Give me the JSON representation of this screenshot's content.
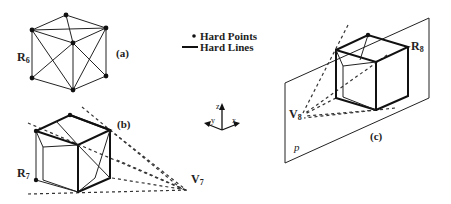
{
  "legend": {
    "hard_points_label": "Hard Points",
    "hard_lines_label": "Hard Lines",
    "point_symbol": "dot",
    "line_symbol": "solid-line"
  },
  "axes_triad": {
    "z_label": "z",
    "y_label": "y",
    "x_label": "x"
  },
  "panels": {
    "a": {
      "caption": "(a)",
      "region_label": "R",
      "region_subscript": "6",
      "description": "Hexagonal silhouette with 7 hard points and triangulated hard lines"
    },
    "b": {
      "caption": "(b)",
      "region_label": "R",
      "region_subscript": "7",
      "viewpoint_label": "V",
      "viewpoint_subscript": "7",
      "description": "Cube viewed from viewpoint V7 with dashed sight lines"
    },
    "c": {
      "caption": "(c)",
      "region_label": "R",
      "region_subscript": "8",
      "viewpoint_label": "V",
      "viewpoint_subscript": "8",
      "plane_label": "p",
      "description": "Cube above plane p viewed from viewpoint V8 with dashed sight lines"
    }
  },
  "colors": {
    "ink": "#111111",
    "background": "#ffffff"
  }
}
